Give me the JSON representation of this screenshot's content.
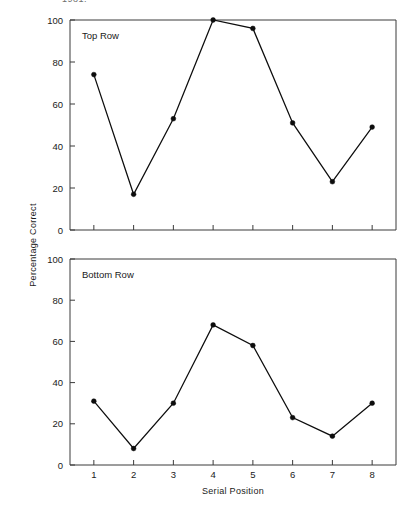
{
  "figure": {
    "clipped_header_text": "1981;",
    "background": "#ffffff",
    "line_color": "#0d0d0d",
    "axis_color": "#3a3a3a",
    "shared_ylabel": "Percentage Correct",
    "xlabel": "Serial Position"
  },
  "chart_data": [
    {
      "type": "line",
      "title": "Top Row",
      "panel": "top",
      "xlabel": "",
      "ylabel": "Percentage Correct",
      "x": [
        1,
        2,
        3,
        4,
        5,
        6,
        7,
        8
      ],
      "categories": [
        "1",
        "2",
        "3",
        "4",
        "5",
        "6",
        "7",
        "8"
      ],
      "values": [
        74,
        17,
        53,
        100,
        96,
        51,
        23,
        49
      ],
      "series": [
        {
          "name": "Top Row",
          "values": [
            74,
            17,
            53,
            100,
            96,
            51,
            23,
            49
          ]
        }
      ],
      "xlim": [
        0.4,
        8.6
      ],
      "ylim": [
        0,
        100
      ],
      "yticks": [
        0,
        20,
        40,
        60,
        80,
        100
      ],
      "ytick_labels": [
        "0",
        "20",
        "40",
        "60",
        "80",
        "100"
      ],
      "xticks": [
        1,
        2,
        3,
        4,
        5,
        6,
        7,
        8
      ],
      "xtick_labels": [
        "1",
        "2",
        "3",
        "4",
        "5",
        "6",
        "7",
        "8"
      ],
      "grid": false,
      "legend": "none",
      "marker": "filled-circle"
    },
    {
      "type": "line",
      "title": "Bottom Row",
      "panel": "bottom",
      "xlabel": "Serial Position",
      "ylabel": "Percentage Correct",
      "x": [
        1,
        2,
        3,
        4,
        5,
        6,
        7,
        8
      ],
      "categories": [
        "1",
        "2",
        "3",
        "4",
        "5",
        "6",
        "7",
        "8"
      ],
      "values": [
        31,
        8,
        30,
        68,
        58,
        23,
        14,
        30
      ],
      "series": [
        {
          "name": "Bottom Row",
          "values": [
            31,
            8,
            30,
            68,
            58,
            23,
            14,
            30
          ]
        }
      ],
      "xlim": [
        0.4,
        8.6
      ],
      "ylim": [
        0,
        100
      ],
      "yticks": [
        0,
        20,
        40,
        60,
        80,
        100
      ],
      "ytick_labels": [
        "0",
        "20",
        "40",
        "60",
        "80",
        "100"
      ],
      "xticks": [
        1,
        2,
        3,
        4,
        5,
        6,
        7,
        8
      ],
      "xtick_labels": [
        "1",
        "2",
        "3",
        "4",
        "5",
        "6",
        "7",
        "8"
      ],
      "grid": false,
      "legend": "none",
      "marker": "filled-circle"
    }
  ]
}
